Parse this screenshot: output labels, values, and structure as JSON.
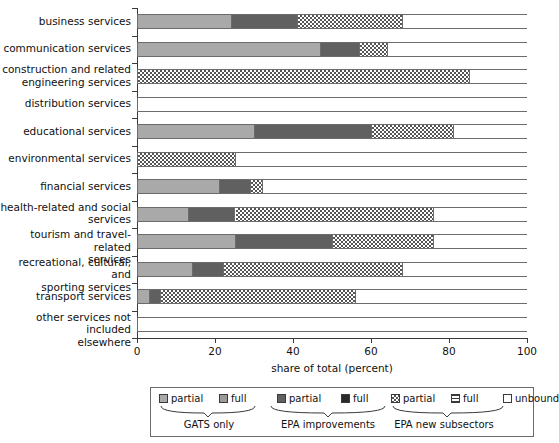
{
  "chart_data": {
    "type": "bar",
    "orientation": "horizontal",
    "stacked": true,
    "title": "",
    "xlabel": "share of total (percent)",
    "ylabel": "",
    "xlim": [
      0,
      100
    ],
    "xticks": [
      0,
      20,
      40,
      60,
      80,
      100
    ],
    "grid": false,
    "legend_position": "bottom",
    "categories": [
      "business services",
      "communication services",
      "construction and related engineering services",
      "distribution services",
      "educational services",
      "environmental services",
      "financial services",
      "health-related and social services",
      "tourism and travel-related services",
      "recreational, cultural, and sporting services",
      "transport services",
      "other services not included elsewhere"
    ],
    "series": [
      {
        "name": "GATS only partial",
        "key": "gats_partial",
        "color": "#a9a9a9",
        "values": [
          24,
          47,
          0,
          0,
          30,
          0,
          21,
          13,
          25,
          14,
          3,
          0
        ]
      },
      {
        "name": "GATS only full",
        "key": "gats_full",
        "color": "#9a9a9a",
        "values": [
          0,
          0,
          0,
          0,
          0,
          0,
          0,
          0,
          0,
          0,
          0,
          0
        ]
      },
      {
        "name": "EPA improvements partial",
        "key": "epa_partial",
        "color": "#606060",
        "values": [
          17,
          10,
          0,
          0,
          30,
          0,
          8,
          12,
          25,
          8,
          3,
          0
        ]
      },
      {
        "name": "EPA improvements full",
        "key": "epa_full",
        "color": "#2a2a2a",
        "values": [
          0,
          0,
          0,
          0,
          0,
          0,
          0,
          0,
          0,
          0,
          0,
          0
        ]
      },
      {
        "name": "EPA new subsectors partial",
        "key": "new_partial",
        "color": "checkerboard",
        "values": [
          27,
          7,
          85,
          0,
          21,
          25,
          3,
          51,
          26,
          46,
          50,
          0
        ]
      },
      {
        "name": "EPA new subsectors full",
        "key": "new_full",
        "color": "hlines",
        "values": [
          0,
          0,
          0,
          0,
          0,
          0,
          0,
          0,
          0,
          0,
          0,
          0
        ]
      },
      {
        "name": "unbound",
        "key": "unbound",
        "color": "#ffffff",
        "values": [
          32,
          36,
          15,
          100,
          19,
          75,
          68,
          24,
          24,
          32,
          44,
          100
        ]
      }
    ]
  },
  "axis": {
    "x_title": "share of total (percent)",
    "x_tick_labels": [
      "0",
      "20",
      "40",
      "60",
      "80",
      "100"
    ]
  },
  "y_labels": [
    [
      "business services"
    ],
    [
      "communication services"
    ],
    [
      "construction and related",
      "engineering services"
    ],
    [
      "distribution services"
    ],
    [
      "educational services"
    ],
    [
      "environmental services"
    ],
    [
      "financial services"
    ],
    [
      "health-related and social",
      "services"
    ],
    [
      "tourism and travel-related",
      "services"
    ],
    [
      "recreational, cultural, and",
      "sporting services"
    ],
    [
      "transport services"
    ],
    [
      "other services not included",
      "elsewhere"
    ]
  ],
  "legend": {
    "items": [
      {
        "label": "partial",
        "swatch": "gats-partial-swatch"
      },
      {
        "label": "full",
        "swatch": "gats-full-swatch"
      },
      {
        "label": "partial",
        "swatch": "epa-partial-swatch"
      },
      {
        "label": "full",
        "swatch": "epa-full-swatch"
      },
      {
        "label": "partial",
        "swatch": "new-partial-swatch"
      },
      {
        "label": "full",
        "swatch": "new-full-swatch"
      },
      {
        "label": "unbound",
        "swatch": "unbound-swatch"
      }
    ],
    "groups": [
      {
        "label": "GATS only"
      },
      {
        "label": "EPA improvements"
      },
      {
        "label": "EPA new subsectors"
      }
    ]
  }
}
